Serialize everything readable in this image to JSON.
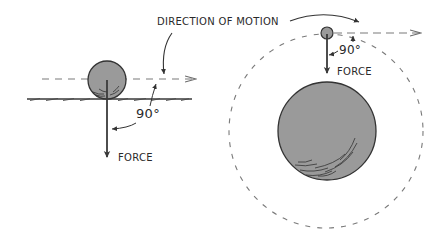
{
  "colors": {
    "background": "#ffffff",
    "ink": "#2e2e2e",
    "ball_fill": "#9a9a9a",
    "dash": "#7a7a7a"
  },
  "labels": {
    "direction_of_motion": "DIRECTION OF MOTION",
    "left_force": "FORCE",
    "left_angle": "90°",
    "right_force": "FORCE",
    "right_angle": "90°"
  },
  "left_scene": {
    "description": "Ball rolling on flat surface, downward force perpendicular to horizontal motion",
    "ball": {
      "cx": 107,
      "cy": 80,
      "r": 19
    },
    "motion_line": {
      "x1": 42,
      "y": 79,
      "x2": 196
    },
    "ground": {
      "x1": 27,
      "y": 99,
      "x2": 192
    },
    "force_arrow": {
      "x": 107,
      "y1": 80,
      "y2": 158
    }
  },
  "right_scene": {
    "description": "Small body orbiting a large planet, force toward center perpendicular to tangential motion",
    "orbiter": {
      "cx": 327,
      "cy": 33,
      "r": 6
    },
    "planet": {
      "cx": 327,
      "cy": 131,
      "r": 49
    },
    "orbit": {
      "cx": 326,
      "cy": 131,
      "r": 97
    },
    "tangent_line": {
      "x1": 333,
      "y": 33,
      "x2": 420
    },
    "force_arrow": {
      "x": 327,
      "y1": 33,
      "y2": 73
    }
  }
}
